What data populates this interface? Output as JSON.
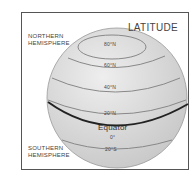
{
  "title": "LATITUDE",
  "labels": {
    "northern": [
      "NORTHERN",
      "HEMISPHERE"
    ],
    "southern": [
      "SOUTHERN",
      "HEMISPHERE"
    ]
  },
  "latitudes": [
    {
      "label": "80°N",
      "y": 44
    },
    {
      "label": "60°N",
      "y": 65
    },
    {
      "label": "40°N",
      "y": 87
    },
    {
      "label": "20°N",
      "y": 112
    },
    {
      "label": "Equator",
      "y": 127
    },
    {
      "label": "0°",
      "y": 137
    },
    {
      "label": "20°S",
      "y": 150
    }
  ],
  "colors": {
    "globe": "#d9d9d9",
    "line": "#777777",
    "equator": "#222222",
    "text": "#444444"
  }
}
